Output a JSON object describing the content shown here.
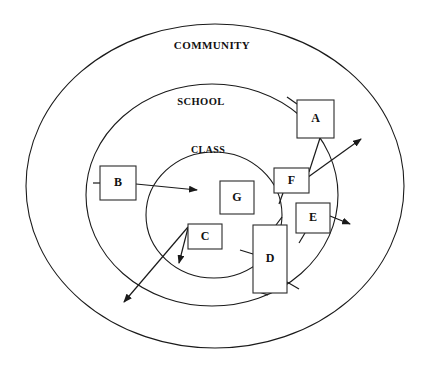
{
  "diagram": {
    "background_color": "#ffffff",
    "stroke_color": "#1a1a1a",
    "rings": [
      {
        "id": "community",
        "label": "COMMUNITY",
        "label_x": 212,
        "label_y": 49,
        "font_size": 11,
        "cx": 215,
        "cy": 186,
        "rx": 189,
        "ry": 162
      },
      {
        "id": "school",
        "label": "SCHOOL",
        "label_x": 201,
        "label_y": 105,
        "font_size": 10.5,
        "cx": 212,
        "cy": 195,
        "rx": 126,
        "ry": 111
      },
      {
        "id": "class",
        "label": "CLASS",
        "label_x": 208,
        "label_y": 153,
        "font_size": 10,
        "cx": 214,
        "cy": 215,
        "rx": 68,
        "ry": 63
      }
    ],
    "nodes": [
      {
        "id": "a",
        "label": "A",
        "x": 297,
        "y": 100,
        "w": 37,
        "h": 38,
        "font_size": 12
      },
      {
        "id": "b",
        "label": "B",
        "x": 100,
        "y": 166,
        "w": 36,
        "h": 34,
        "font_size": 12
      },
      {
        "id": "c",
        "label": "C",
        "x": 188,
        "y": 224,
        "w": 34,
        "h": 25,
        "font_size": 12
      },
      {
        "id": "d",
        "label": "D",
        "x": 253,
        "y": 225,
        "w": 34,
        "h": 68,
        "font_size": 12
      },
      {
        "id": "e",
        "label": "E",
        "x": 296,
        "y": 203,
        "w": 34,
        "h": 30,
        "font_size": 12
      },
      {
        "id": "f",
        "label": "F",
        "x": 274,
        "y": 168,
        "w": 35,
        "h": 25,
        "font_size": 12
      },
      {
        "id": "g",
        "label": "G",
        "x": 220,
        "y": 181,
        "w": 34,
        "h": 33,
        "font_size": 12
      }
    ],
    "connectors": [
      {
        "id": "b-to-g",
        "from": "b",
        "to": "class-interior",
        "arrow": true,
        "path": "M 136 184 L 197 190"
      },
      {
        "id": "f-outward",
        "from": "f",
        "to": "community-edge",
        "arrow": true,
        "path": "M 304 180 L 361 139"
      },
      {
        "id": "a-to-f",
        "from": "a",
        "to": "f",
        "arrow": false,
        "path": "M 320 138 L 309 172"
      },
      {
        "id": "e-outward",
        "from": "e",
        "to": "community-edge",
        "arrow": true,
        "path": "M 330 216 L 350 224"
      },
      {
        "id": "c-short-outward",
        "from": "c",
        "to": "class-edge",
        "arrow": true,
        "path": "M 188 228 L 179 263"
      },
      {
        "id": "c-long-outward",
        "from": "c",
        "to": "community-edge",
        "arrow": true,
        "path": "M 188 227 L 124 302"
      },
      {
        "id": "d-left-tail",
        "from": "d",
        "to": "class-edge",
        "arrow": false,
        "path": "M 253 254 L 240 250"
      },
      {
        "id": "d-top-tail",
        "from": "d",
        "to": "school-edge",
        "arrow": false,
        "path": "M 276 225 L 282 217"
      },
      {
        "id": "d-bottom-tail",
        "from": "d",
        "to": "school-edge",
        "arrow": false,
        "path": "M 287 282 L 299 289"
      },
      {
        "id": "d-base-tail",
        "from": "d",
        "to": "school-edge",
        "arrow": false,
        "path": "M 253 290 L 268 295"
      },
      {
        "id": "e-bottom-tail",
        "from": "e",
        "to": "school-edge",
        "arrow": false,
        "path": "M 305 233 L 299 243"
      },
      {
        "id": "f-bottom-tail",
        "from": "f",
        "to": "class-edge",
        "arrow": false,
        "path": "M 283 193 L 279 204"
      },
      {
        "id": "a-top-tail",
        "from": "a",
        "to": "school-edge",
        "arrow": false,
        "path": "M 297 104 L 287 97"
      },
      {
        "id": "b-left-tail",
        "from": "b",
        "to": "school-edge",
        "arrow": false,
        "path": "M 100 183 L 93 183"
      }
    ]
  }
}
